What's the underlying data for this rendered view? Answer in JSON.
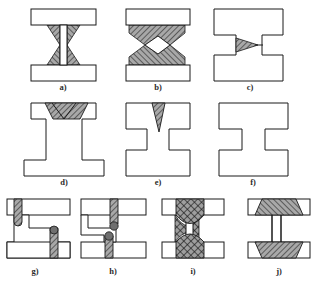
{
  "figure": {
    "background_color": "#ffffff",
    "outline_color": "#1a1a1a",
    "member_fill": "#ffffff",
    "weld_fill": "#a8a8a8",
    "weld_fill_dark": "#8a8a8a",
    "hatch_color": "#1a1a1a",
    "label_color": "#2b2b2b",
    "rows": 3,
    "panel_count": 10
  },
  "panels": [
    {
      "id": "a",
      "label": "a)",
      "row": 1,
      "description": "I-beam, straight web, bowtie bevel welds at both flange junctions",
      "weld_pattern": "diagonal-hatch",
      "weld_shape": "bowtie",
      "flanges": 2,
      "weld_zones": 4
    },
    {
      "id": "b",
      "label": "b)",
      "row": 1,
      "description": "I-beam, waisted web, large hatched trapezoid welds with V-notches",
      "weld_pattern": "diagonal-hatch",
      "weld_shape": "trapezoid-v-notch",
      "flanges": 2,
      "weld_zones": 4
    },
    {
      "id": "c",
      "label": "c)",
      "row": 1,
      "description": "Continuous H-profile outline, single small triangular weld at mid web",
      "weld_pattern": "diagonal-hatch",
      "weld_shape": "triangle",
      "flanges": 2,
      "weld_zones": 1
    },
    {
      "id": "d",
      "label": "d)",
      "row": 2,
      "description": "I-beam, trapezoidal hatched weld filling top flange with V-groove",
      "weld_pattern": "diagonal-hatch",
      "weld_shape": "trapezoid-v-groove",
      "flanges": 2,
      "weld_zones": 1
    },
    {
      "id": "e",
      "label": "e)",
      "row": 2,
      "description": "I-beam, narrow inverted triangular weld at top flange",
      "weld_pattern": "diagonal-hatch",
      "weld_shape": "narrow-triangle",
      "flanges": 2,
      "weld_zones": 1
    },
    {
      "id": "f",
      "label": "f)",
      "row": 2,
      "description": "Plain I-beam outline, no weld deposit shown",
      "weld_pattern": "none",
      "weld_shape": "none",
      "flanges": 2,
      "weld_zones": 0
    },
    {
      "id": "g",
      "label": "g)",
      "row": 3,
      "description": "Staggered offset flanges, two vertical hatched welds with rounded roots",
      "weld_pattern": "diagonal-hatch",
      "weld_shape": "vertical-strip",
      "flanges": 2,
      "weld_zones": 2
    },
    {
      "id": "h",
      "label": "h)",
      "row": 3,
      "description": "Stepped web, two vertical hatched welds with rounded roots",
      "weld_pattern": "diagonal-hatch",
      "weld_shape": "vertical-strip",
      "flanges": 2,
      "weld_zones": 2
    },
    {
      "id": "i",
      "label": "i)",
      "row": 3,
      "description": "I-beam with dense cross-hatched weld zones and curved fillet boundaries",
      "weld_pattern": "cross-hatch",
      "weld_shape": "curved-fillet",
      "flanges": 2,
      "weld_zones": 2
    },
    {
      "id": "j",
      "label": "j)",
      "row": 3,
      "description": "I-beam with large trapezoidal hatched welds spanning flange width",
      "weld_pattern": "diagonal-hatch",
      "weld_shape": "trapezoid",
      "flanges": 2,
      "weld_zones": 2
    }
  ]
}
